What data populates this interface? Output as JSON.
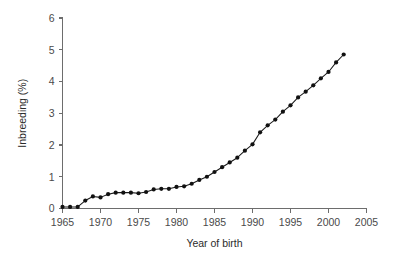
{
  "chart_data": {
    "type": "line",
    "title": "",
    "xlabel": "Year of birth",
    "ylabel": "Inbreeding (%)",
    "xlim": [
      1965,
      2005
    ],
    "ylim": [
      0,
      6
    ],
    "xticks": [
      1965,
      1970,
      1975,
      1980,
      1985,
      1990,
      1995,
      2000,
      2005
    ],
    "xtick_labels": [
      "1965",
      "1970",
      "1975",
      "1980",
      "1985",
      "1990",
      "1995",
      "2000",
      "2005"
    ],
    "yticks": [
      0,
      1,
      2,
      3,
      4,
      5,
      6
    ],
    "ytick_labels": [
      "0",
      "1",
      "2",
      "3",
      "4",
      "5",
      "6"
    ],
    "grid": false,
    "legend": null,
    "marker": "filled-circle",
    "line_color": "#111111",
    "marker_color": "#111111",
    "axis_color": "#6d6d6d",
    "background_color": "#ffffff",
    "series": [
      {
        "name": "Inbreeding coefficient",
        "x": [
          1965,
          1966,
          1967,
          1968,
          1969,
          1970,
          1971,
          1972,
          1973,
          1974,
          1975,
          1976,
          1977,
          1978,
          1979,
          1980,
          1981,
          1982,
          1983,
          1984,
          1985,
          1986,
          1987,
          1988,
          1989,
          1990,
          1991,
          1992,
          1993,
          1994,
          1995,
          1996,
          1997,
          1998,
          1999,
          2000,
          2001,
          2002
        ],
        "values": [
          0.05,
          0.05,
          0.05,
          0.25,
          0.38,
          0.35,
          0.45,
          0.5,
          0.5,
          0.5,
          0.48,
          0.52,
          0.6,
          0.62,
          0.62,
          0.68,
          0.7,
          0.78,
          0.9,
          1.0,
          1.15,
          1.3,
          1.45,
          1.6,
          1.82,
          2.02,
          2.4,
          2.62,
          2.8,
          3.05,
          3.25,
          3.5,
          3.68,
          3.88,
          4.1,
          4.3,
          4.6,
          4.85
        ]
      }
    ]
  }
}
